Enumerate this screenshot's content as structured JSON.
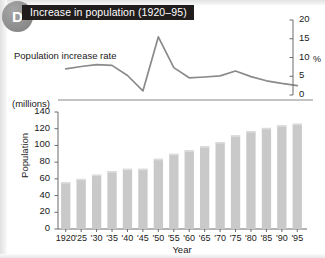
{
  "badge": {
    "letter": "D"
  },
  "title": "Increase in population (1920–95)",
  "line_label": "Population increase rate",
  "axes": {
    "left_unit": "(millions)",
    "left_title": "Population",
    "bottom_title": "Year",
    "right_unit": "%"
  },
  "chart_data": [
    {
      "type": "line",
      "title": "Increase in population (1920–95)",
      "name": "Population increase rate",
      "xlabel": "Year",
      "ylabel": "%",
      "ylim": [
        0,
        20
      ],
      "yticks": [
        0,
        5,
        10,
        15,
        20
      ],
      "grid": false,
      "legend": "none",
      "categories": [
        "1920",
        "'25",
        "'30",
        "'35",
        "'40",
        "'45",
        "'50",
        "'55",
        "'60",
        "'65",
        "'70",
        "'75",
        "'80",
        "'85",
        "'90",
        "'95"
      ],
      "values": [
        7.0,
        7.6,
        8.1,
        7.9,
        5.2,
        1.1,
        15.5,
        7.3,
        4.6,
        4.8,
        5.1,
        6.4,
        4.9,
        3.8,
        3.1,
        2.5
      ]
    },
    {
      "type": "bar",
      "title": "Increase in population (1920–95)",
      "name": "Population",
      "xlabel": "Year",
      "ylabel": "Population",
      "yunit": "(millions)",
      "ylim": [
        0,
        140
      ],
      "yticks": [
        0,
        20,
        40,
        60,
        80,
        100,
        120,
        140
      ],
      "grid": false,
      "legend": "none",
      "bar_color": "#c9c9c9",
      "categories": [
        "1920",
        "'25",
        "'30",
        "'35",
        "'40",
        "'45",
        "'50",
        "'55",
        "'60",
        "'65",
        "'70",
        "'75",
        "'80",
        "'85",
        "'90",
        "'95"
      ],
      "values": [
        56,
        60,
        65,
        69,
        72,
        72,
        84,
        90,
        94,
        99,
        104,
        112,
        117,
        121,
        124,
        126
      ]
    }
  ]
}
